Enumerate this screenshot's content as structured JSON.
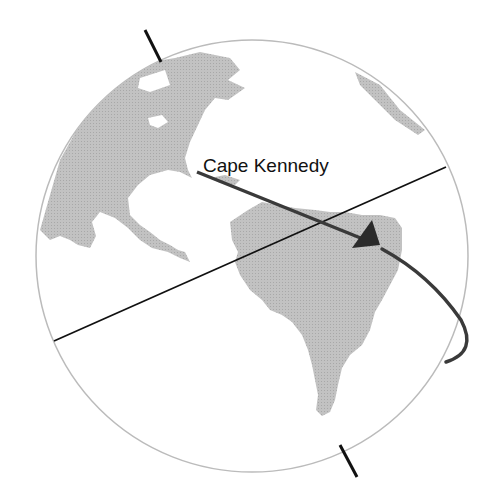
{
  "diagram": {
    "label": "Cape Kennedy",
    "colors": {
      "land": "#bdbdbd",
      "globe_outline": "#bbbbbb",
      "axis": "#111111",
      "trajectory": "#3a3a3a"
    },
    "elements": [
      "globe",
      "rotation-axis",
      "equator-line",
      "trajectory-arrow",
      "north-america",
      "south-america"
    ]
  }
}
